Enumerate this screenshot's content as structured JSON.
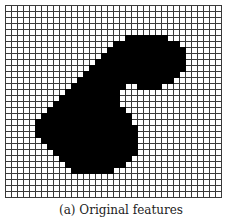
{
  "figure": {
    "caption": "(a) Original features",
    "grid": {
      "cols": 36,
      "rows": 32,
      "cell_px": 6,
      "line_color": "#3a3a3a",
      "background_color": "#ffffff",
      "fill_color": "#000000"
    },
    "filled_cells": [
      {
        "row": 5,
        "spans": [
          [
            20,
            26
          ]
        ]
      },
      {
        "row": 6,
        "spans": [
          [
            18,
            28
          ]
        ]
      },
      {
        "row": 7,
        "spans": [
          [
            17,
            29
          ]
        ]
      },
      {
        "row": 8,
        "spans": [
          [
            16,
            29
          ]
        ]
      },
      {
        "row": 9,
        "spans": [
          [
            15,
            29
          ]
        ]
      },
      {
        "row": 10,
        "spans": [
          [
            14,
            29
          ]
        ]
      },
      {
        "row": 11,
        "spans": [
          [
            13,
            28
          ]
        ]
      },
      {
        "row": 12,
        "spans": [
          [
            12,
            20
          ],
          [
            21,
            27
          ]
        ]
      },
      {
        "row": 13,
        "spans": [
          [
            11,
            19
          ],
          [
            22,
            25
          ]
        ]
      },
      {
        "row": 14,
        "spans": [
          [
            10,
            18
          ]
        ]
      },
      {
        "row": 15,
        "spans": [
          [
            9,
            18
          ]
        ]
      },
      {
        "row": 16,
        "spans": [
          [
            8,
            18
          ]
        ]
      },
      {
        "row": 17,
        "spans": [
          [
            7,
            19
          ]
        ]
      },
      {
        "row": 18,
        "spans": [
          [
            6,
            20
          ]
        ]
      },
      {
        "row": 19,
        "spans": [
          [
            5,
            20
          ]
        ]
      },
      {
        "row": 20,
        "spans": [
          [
            5,
            21
          ]
        ]
      },
      {
        "row": 21,
        "spans": [
          [
            5,
            21
          ]
        ]
      },
      {
        "row": 22,
        "spans": [
          [
            6,
            21
          ]
        ]
      },
      {
        "row": 23,
        "spans": [
          [
            7,
            21
          ]
        ]
      },
      {
        "row": 24,
        "spans": [
          [
            8,
            21
          ]
        ]
      },
      {
        "row": 25,
        "spans": [
          [
            9,
            20
          ]
        ]
      },
      {
        "row": 26,
        "spans": [
          [
            10,
            19
          ]
        ]
      },
      {
        "row": 27,
        "spans": [
          [
            11,
            17
          ]
        ]
      }
    ]
  }
}
